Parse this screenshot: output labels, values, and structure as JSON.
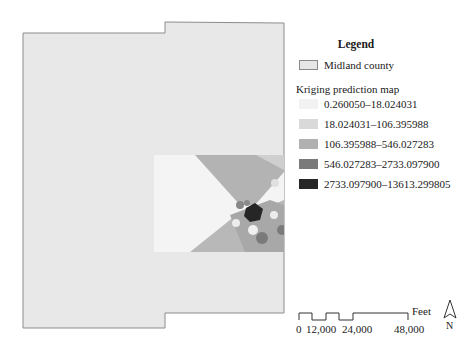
{
  "legend": {
    "title": "Legend",
    "county_label": "Midland county",
    "kriging_title": "Kriging prediction map",
    "classes": [
      {
        "range": "0.260050–18.024031",
        "color": "#f2f2f2"
      },
      {
        "range": "18.024031–106.395988",
        "color": "#d9d9d9"
      },
      {
        "range": "106.395988–546.027283",
        "color": "#b0b0b0"
      },
      {
        "range": "546.027283–2733.097900",
        "color": "#7a7a7a"
      },
      {
        "range": "2733.097900–13613.299805",
        "color": "#262626"
      }
    ],
    "county_fill": "#e6e6e6"
  },
  "scale_bar": {
    "unit": "Feet",
    "ticks": [
      "0",
      "12,000",
      "24,000",
      "48,000"
    ]
  },
  "north_arrow": {
    "label": "N"
  }
}
